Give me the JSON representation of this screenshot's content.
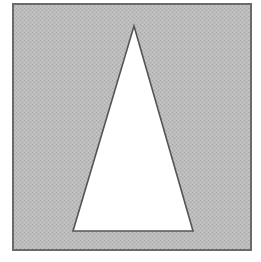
{
  "figure": {
    "title": "Isosceles triangle on shaded square background",
    "canvas": {
      "width": 261,
      "height": 262,
      "background_color": "#ffffff"
    },
    "frame": {
      "name": "outer-square-frame",
      "x": 13,
      "y": 4,
      "width": 238,
      "height": 246,
      "fill_color": "#b5b5b5",
      "fill_style": "dithered-halftone-gray",
      "stroke_color": "#6a6a6a",
      "stroke_width": 2
    },
    "shape": {
      "name": "triangle",
      "kind": "isosceles-triangle",
      "fill_color": "#ffffff",
      "stroke_color": "#555555",
      "stroke_width": 1.6,
      "points_label": "134,26 193,231 73,231",
      "vertices": [
        {
          "label": "apex",
          "x": 134,
          "y": 26
        },
        {
          "label": "base-right",
          "x": 193,
          "y": 231
        },
        {
          "label": "base-left",
          "x": 73,
          "y": 231
        }
      ],
      "base_width": 120,
      "height": 205
    }
  }
}
